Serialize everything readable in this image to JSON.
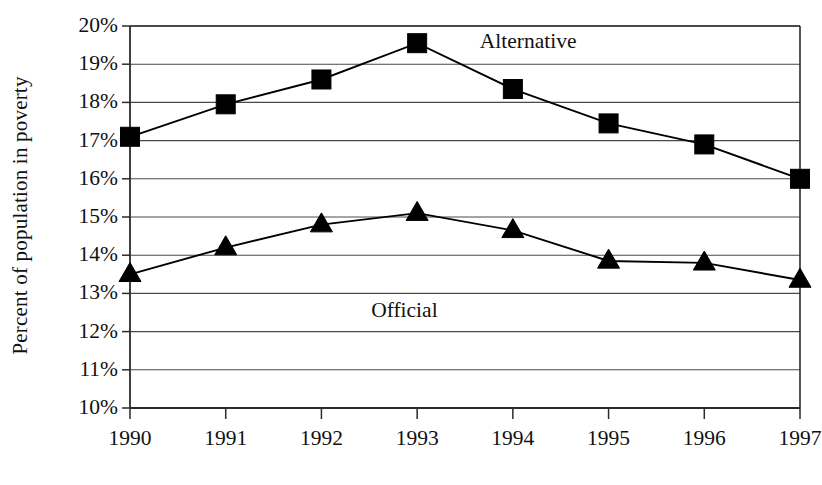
{
  "chart_data": {
    "type": "line",
    "title": "",
    "subtitle": "",
    "xlabel": "",
    "ylabel": "Percent of population in poverty",
    "categories": [
      "1990",
      "1991",
      "1992",
      "1993",
      "1994",
      "1995",
      "1996",
      "1997"
    ],
    "x": [
      1990,
      1991,
      1992,
      1993,
      1994,
      1995,
      1996,
      1997
    ],
    "xlim": [
      1990,
      1997
    ],
    "ylim": [
      10,
      20
    ],
    "ytick_labels": [
      "10%",
      "11%",
      "12%",
      "13%",
      "14%",
      "15%",
      "16%",
      "17%",
      "18%",
      "19%",
      "20%"
    ],
    "ytick_values": [
      10,
      11,
      12,
      13,
      14,
      15,
      16,
      17,
      18,
      19,
      20
    ],
    "grid": "horizontal",
    "legend_position": "inline-annotation",
    "series": [
      {
        "name": "Alternative",
        "marker": "square",
        "color": "#000000",
        "values": [
          17.1,
          17.95,
          18.6,
          19.55,
          18.35,
          17.45,
          16.9,
          16.0
        ],
        "annotation": {
          "label": "Alternative",
          "x": 1993.55,
          "y": 19.55
        }
      },
      {
        "name": "Official",
        "marker": "triangle",
        "color": "#000000",
        "values": [
          13.5,
          14.2,
          14.8,
          15.1,
          14.65,
          13.85,
          13.8,
          13.35
        ],
        "annotation": {
          "label": "Official",
          "x": 1993.0,
          "y": 13.15
        }
      }
    ],
    "annotations": [
      {
        "text": "Alternative",
        "series": "Alternative"
      },
      {
        "text": "Official",
        "series": "Official"
      }
    ]
  },
  "axis": {
    "y_title": "Percent of population in poverty"
  }
}
